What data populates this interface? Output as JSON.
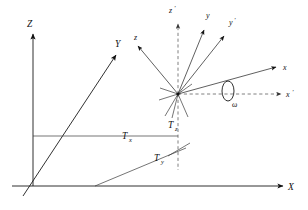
{
  "figure": {
    "type": "coordinate-frame-diagram",
    "background_color": "#ffffff",
    "line_color": "#1a1a1a",
    "dashed_color": "#555555"
  },
  "world_frame": {
    "origin_label": "",
    "axes": [
      {
        "name": "Z",
        "label": "Z",
        "direction": "up",
        "label_x": 27,
        "label_y": 27
      },
      {
        "name": "Y",
        "label": "Y",
        "direction": "upper-right-oblique",
        "label_x": 115,
        "label_y": 47
      },
      {
        "name": "X",
        "label": "X",
        "direction": "right",
        "label_x": 288,
        "label_y": 186
      }
    ]
  },
  "body_frame": {
    "origin_x": 178,
    "origin_y": 94,
    "axes": [
      {
        "name": "z-prime",
        "label": "z",
        "prime": "'",
        "label_x": 169,
        "label_y": 13
      },
      {
        "name": "y",
        "label": "y",
        "prime": "",
        "label_x": 206,
        "label_y": 18
      },
      {
        "name": "y-prime",
        "label": "y",
        "prime": "'",
        "label_x": 229,
        "label_y": 25
      },
      {
        "name": "x",
        "label": "x",
        "prime": "",
        "label_x": 283,
        "label_y": 70
      },
      {
        "name": "x-prime",
        "label": "x",
        "prime": "'",
        "label_x": 288,
        "label_y": 96
      },
      {
        "name": "z",
        "label": "z",
        "prime": "",
        "label_x": 134,
        "label_y": 40
      }
    ]
  },
  "translation_labels": [
    {
      "name": "Tx",
      "base": "T",
      "sub": "x",
      "x": 122,
      "y": 139
    },
    {
      "name": "Ty",
      "base": "T",
      "sub": "y",
      "x": 154,
      "y": 161
    },
    {
      "name": "Tz",
      "base": "T",
      "sub": "z",
      "x": 168,
      "y": 128
    }
  ],
  "rotation": {
    "name": "omega",
    "symbol": "ω",
    "label_x": 232,
    "label_y": 107,
    "ellipse_cx": 228,
    "ellipse_cy": 91,
    "ellipse_rx": 6,
    "ellipse_ry": 10
  }
}
